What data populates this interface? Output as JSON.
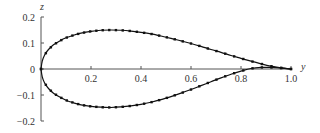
{
  "chart_data": {
    "type": "line",
    "title": "",
    "xlabel": "y",
    "ylabel": "z",
    "xlim": [
      0,
      1.0
    ],
    "ylim": [
      -0.2,
      0.2
    ],
    "grid": false,
    "legend": null,
    "x_ticks": [
      "0.2",
      "0.4",
      "0.6",
      "0.8",
      "1.0"
    ],
    "y_ticks": [
      "0.2",
      "0.1",
      "0",
      "-0.1",
      "-0.2"
    ],
    "series": [
      {
        "name": "upper surface",
        "style": "line with square markers",
        "x": [
          0.0,
          0.005,
          0.015,
          0.03,
          0.05,
          0.075,
          0.1,
          0.13,
          0.16,
          0.2,
          0.24,
          0.28,
          0.32,
          0.36,
          0.4,
          0.44,
          0.48,
          0.52,
          0.56,
          0.6,
          0.64,
          0.68,
          0.72,
          0.76,
          0.8,
          0.84,
          0.88,
          0.92,
          0.96,
          1.0
        ],
        "values": [
          0.0,
          0.03,
          0.055,
          0.075,
          0.093,
          0.108,
          0.12,
          0.13,
          0.138,
          0.145,
          0.149,
          0.15,
          0.149,
          0.146,
          0.141,
          0.135,
          0.127,
          0.118,
          0.108,
          0.098,
          0.087,
          0.075,
          0.064,
          0.052,
          0.041,
          0.03,
          0.02,
          0.011,
          0.004,
          0.0
        ]
      },
      {
        "name": "lower surface",
        "style": "line with square markers",
        "x": [
          0.0,
          0.005,
          0.015,
          0.03,
          0.05,
          0.075,
          0.1,
          0.13,
          0.16,
          0.2,
          0.24,
          0.28,
          0.32,
          0.36,
          0.4,
          0.44,
          0.48,
          0.52,
          0.56,
          0.6,
          0.64,
          0.68,
          0.72,
          0.76,
          0.8,
          0.84,
          0.88,
          0.92,
          0.96,
          1.0
        ],
        "values": [
          0.0,
          -0.03,
          -0.055,
          -0.075,
          -0.093,
          -0.108,
          -0.12,
          -0.13,
          -0.138,
          -0.144,
          -0.147,
          -0.148,
          -0.146,
          -0.142,
          -0.136,
          -0.128,
          -0.118,
          -0.106,
          -0.093,
          -0.079,
          -0.064,
          -0.049,
          -0.034,
          -0.02,
          -0.008,
          0.002,
          0.006,
          0.006,
          0.004,
          0.0
        ]
      }
    ]
  },
  "colors": {
    "axis": "#555555",
    "curve": "#111111",
    "text": "#333333"
  }
}
